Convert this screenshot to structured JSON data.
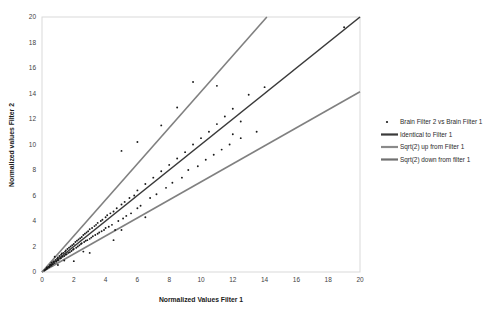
{
  "chart_data": {
    "type": "scatter",
    "title": "",
    "xlabel": "Normalized Values Filter 1",
    "ylabel": "Normalized values Filter 2",
    "xlim": [
      0,
      20
    ],
    "ylim": [
      0,
      20
    ],
    "xticks": [
      "0",
      "2",
      "4",
      "6",
      "8",
      "10",
      "12",
      "14",
      "16",
      "18",
      "20"
    ],
    "yticks": [
      "0",
      "2",
      "4",
      "6",
      "8",
      "10",
      "12",
      "14",
      "16",
      "18",
      "20"
    ],
    "grid": false,
    "legend_position": "right",
    "series": [
      {
        "name": "Brain Filter 2 vs Brain Filter 1",
        "type": "scatter",
        "marker": "dot",
        "color": "#1a1a1a",
        "points": [
          [
            0.15,
            0.12
          ],
          [
            0.2,
            0.18
          ],
          [
            0.25,
            0.22
          ],
          [
            0.3,
            0.25
          ],
          [
            0.3,
            0.35
          ],
          [
            0.35,
            0.3
          ],
          [
            0.4,
            0.42
          ],
          [
            0.45,
            0.38
          ],
          [
            0.5,
            0.55
          ],
          [
            0.5,
            0.45
          ],
          [
            0.55,
            0.6
          ],
          [
            0.6,
            0.5
          ],
          [
            0.6,
            0.72
          ],
          [
            0.65,
            0.6
          ],
          [
            0.7,
            0.78
          ],
          [
            0.7,
            0.62
          ],
          [
            0.75,
            0.85
          ],
          [
            0.8,
            0.7
          ],
          [
            0.85,
            0.95
          ],
          [
            0.9,
            0.8
          ],
          [
            0.95,
            1.05
          ],
          [
            1.0,
            0.9
          ],
          [
            1.0,
            1.15
          ],
          [
            1.05,
            0.95
          ],
          [
            1.1,
            1.25
          ],
          [
            1.15,
            1.05
          ],
          [
            1.2,
            1.35
          ],
          [
            1.2,
            1.1
          ],
          [
            1.25,
            1.45
          ],
          [
            1.3,
            1.2
          ],
          [
            1.35,
            1.5
          ],
          [
            1.4,
            1.25
          ],
          [
            1.45,
            1.6
          ],
          [
            1.5,
            1.35
          ],
          [
            1.5,
            1.7
          ],
          [
            1.55,
            1.4
          ],
          [
            1.6,
            1.8
          ],
          [
            1.65,
            1.5
          ],
          [
            1.7,
            1.9
          ],
          [
            1.75,
            1.55
          ],
          [
            1.8,
            2.0
          ],
          [
            1.85,
            1.65
          ],
          [
            1.9,
            2.1
          ],
          [
            1.95,
            1.75
          ],
          [
            2.0,
            2.2
          ],
          [
            2.0,
            1.8
          ],
          [
            2.1,
            2.35
          ],
          [
            2.15,
            1.9
          ],
          [
            2.2,
            2.45
          ],
          [
            2.25,
            2.0
          ],
          [
            2.3,
            2.55
          ],
          [
            2.35,
            2.1
          ],
          [
            2.4,
            2.65
          ],
          [
            2.45,
            2.2
          ],
          [
            2.5,
            2.75
          ],
          [
            2.5,
            2.25
          ],
          [
            2.6,
            2.9
          ],
          [
            2.65,
            2.35
          ],
          [
            2.7,
            3.0
          ],
          [
            2.75,
            2.45
          ],
          [
            2.8,
            3.1
          ],
          [
            2.85,
            2.5
          ],
          [
            2.9,
            3.2
          ],
          [
            3.0,
            2.6
          ],
          [
            3.0,
            3.35
          ],
          [
            3.1,
            2.7
          ],
          [
            3.15,
            3.45
          ],
          [
            3.2,
            2.8
          ],
          [
            3.3,
            3.6
          ],
          [
            3.35,
            2.9
          ],
          [
            3.4,
            3.7
          ],
          [
            3.5,
            3.0
          ],
          [
            3.5,
            3.85
          ],
          [
            3.6,
            3.1
          ],
          [
            3.7,
            4.0
          ],
          [
            3.75,
            3.2
          ],
          [
            3.8,
            4.1
          ],
          [
            3.9,
            3.3
          ],
          [
            4.0,
            4.3
          ],
          [
            4.0,
            3.45
          ],
          [
            4.1,
            4.45
          ],
          [
            4.2,
            3.55
          ],
          [
            4.3,
            4.6
          ],
          [
            4.4,
            3.7
          ],
          [
            4.5,
            4.75
          ],
          [
            4.6,
            3.3
          ],
          [
            4.7,
            5.0
          ],
          [
            4.8,
            4.0
          ],
          [
            5.0,
            5.3
          ],
          [
            5.1,
            4.2
          ],
          [
            5.2,
            5.5
          ],
          [
            5.3,
            4.4
          ],
          [
            5.5,
            5.8
          ],
          [
            5.6,
            4.6
          ],
          [
            5.8,
            6.0
          ],
          [
            6.0,
            5.0
          ],
          [
            6.0,
            6.4
          ],
          [
            6.2,
            5.2
          ],
          [
            6.5,
            6.9
          ],
          [
            6.8,
            5.8
          ],
          [
            7.0,
            7.4
          ],
          [
            7.2,
            6.1
          ],
          [
            7.5,
            7.9
          ],
          [
            7.8,
            6.6
          ],
          [
            8.0,
            8.4
          ],
          [
            8.2,
            7.0
          ],
          [
            8.5,
            8.9
          ],
          [
            8.8,
            7.4
          ],
          [
            9.0,
            9.4
          ],
          [
            9.2,
            8.0
          ],
          [
            9.5,
            10.0
          ],
          [
            9.8,
            8.3
          ],
          [
            10.0,
            10.5
          ],
          [
            10.3,
            8.8
          ],
          [
            10.5,
            11.0
          ],
          [
            10.8,
            9.2
          ],
          [
            11.0,
            11.6
          ],
          [
            11.3,
            9.6
          ],
          [
            11.5,
            12.2
          ],
          [
            11.8,
            10.0
          ],
          [
            12.0,
            12.8
          ],
          [
            12.5,
            10.5
          ],
          [
            13.0,
            13.9
          ],
          [
            13.5,
            11.0
          ],
          [
            14.0,
            14.5
          ],
          [
            5.0,
            9.5
          ],
          [
            6.0,
            10.2
          ],
          [
            7.5,
            11.5
          ],
          [
            8.5,
            12.9
          ],
          [
            9.5,
            14.9
          ],
          [
            11.0,
            14.6
          ],
          [
            12.0,
            10.8
          ],
          [
            12.5,
            11.8
          ],
          [
            19.0,
            19.2
          ],
          [
            2.0,
            0.85
          ],
          [
            3.0,
            1.5
          ],
          [
            4.5,
            2.5
          ],
          [
            5.0,
            3.3
          ],
          [
            6.5,
            4.3
          ],
          [
            1.0,
            0.55
          ],
          [
            0.8,
            1.2
          ],
          [
            1.4,
            0.9
          ],
          [
            2.6,
            1.6
          ]
        ]
      },
      {
        "name": "Identical to Filter 1",
        "type": "line",
        "color": "#3a3a3a",
        "slope": 1.0,
        "x_from": 0,
        "x_to": 20
      },
      {
        "name": "Sqrt(2) up from Filter 1",
        "type": "line",
        "color": "#808080",
        "slope": 1.41421,
        "x_from": 0,
        "x_to": 14.142
      },
      {
        "name": "Sqrt(2) down from filter 1",
        "type": "line",
        "color": "#808080",
        "slope": 0.70711,
        "x_from": 0,
        "x_to": 20
      }
    ]
  },
  "legend": {
    "items": [
      {
        "label": "Brain Filter 2 vs Brain Filter 1",
        "marker": "dot",
        "color": "#1a1a1a"
      },
      {
        "label": "Identical to Filter 1",
        "marker": "line",
        "color": "#3a3a3a"
      },
      {
        "label": "Sqrt(2) up from Filter 1",
        "marker": "line",
        "color": "#8a8a8a"
      },
      {
        "label": "Sqrt(2) down from filter 1",
        "marker": "line",
        "color": "#707070"
      }
    ]
  }
}
